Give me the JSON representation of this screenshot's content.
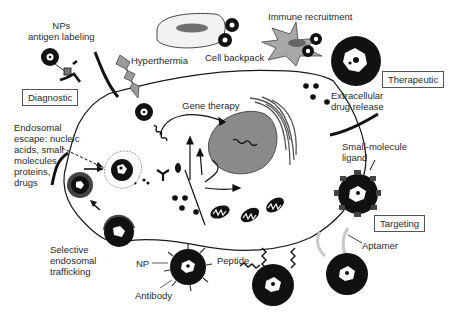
{
  "diagram": {
    "type": "nanoparticle-applications-cell-schematic",
    "categories": [
      {
        "id": "diagnostic",
        "label": "Diagnostic"
      },
      {
        "id": "therapeutic",
        "label": "Therapeutic"
      },
      {
        "id": "targeting",
        "label": "Targeting"
      }
    ],
    "labels": {
      "nps_antigen": "NPs\nantigen labeling",
      "hyperthermia": "Hyperthermia",
      "cell_backpack": "Cell backpack",
      "immune_recruitment": "Immune recruitment",
      "extracellular_release": "Extracellular\ndrug release",
      "gene_therapy": "Gene therapy",
      "endosomal_escape": "Endosomal\nescape: nucleic\nacids, small\nmolecules,\nproteins,\ndrugs",
      "small_molecule_ligand": "Small-molecule\nligand",
      "selective_trafficking": "Selective\nendosomal\ntrafficking",
      "np": "NP",
      "antibody": "Antibody",
      "peptide": "Peptide",
      "aptamer": "Aptamer"
    },
    "colors": {
      "np_fill": "#111111",
      "nucleus": "#8a8a8a",
      "lightning": "#9a9a9a",
      "immune_cell": "#a8a8a8",
      "membrane": "#1a1a1a",
      "box_border": "#555555"
    }
  }
}
